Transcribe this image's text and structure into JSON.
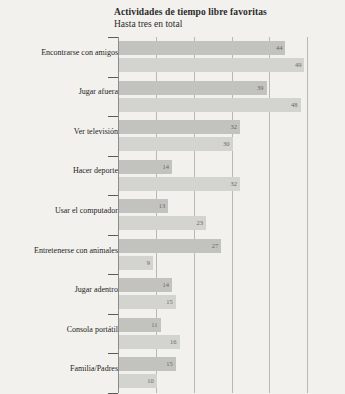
{
  "header": {
    "title": "Actividades de tiempo libre favoritas",
    "subtitle": "Hasta tres en total"
  },
  "chart_data": {
    "type": "bar",
    "orientation": "horizontal",
    "title": "Actividades de tiempo libre favoritas",
    "subtitle": "Hasta tres en total",
    "xlabel": "",
    "ylabel": "",
    "xlim": [
      0,
      60
    ],
    "grid": true,
    "gridlines": [
      10,
      20,
      30,
      40,
      50
    ],
    "legend": "none",
    "categories": [
      "Encontrarse con amigos",
      "Jugar afuera",
      "Ver televisión",
      "Hacer deporte",
      "Usar el computador",
      "Entretenerse con animales",
      "Jugar adentro",
      "Consola portátil",
      "Familia/Padres"
    ],
    "series": [
      {
        "name": "serie-1",
        "color": "#c2c2bf",
        "values": [
          44,
          39,
          32,
          14,
          13,
          27,
          14,
          11,
          15
        ]
      },
      {
        "name": "serie-2",
        "color": "#d3d3d0",
        "values": [
          49,
          48,
          30,
          32,
          23,
          9,
          15,
          16,
          10
        ]
      }
    ],
    "value_labels": [
      [
        "44",
        "49"
      ],
      [
        "39",
        "48"
      ],
      [
        "32",
        "30"
      ],
      [
        "14",
        "32"
      ],
      [
        "13",
        "23"
      ],
      [
        "27",
        "9"
      ],
      [
        "14",
        "15"
      ],
      [
        "11",
        "16"
      ],
      [
        "15",
        "10"
      ]
    ]
  },
  "colors": {
    "background": "#f2f1ed",
    "series_dark": "#c2c2bf",
    "series_light": "#d3d3d0",
    "gridline": "#b9b8b3",
    "axis": "#8d8c88",
    "text": "#242424"
  }
}
